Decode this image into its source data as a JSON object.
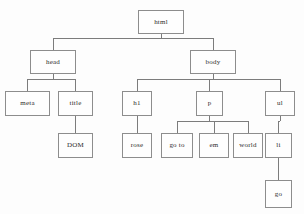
{
  "diagram": {
    "type": "tree",
    "background_color": "#fdfdfd",
    "box_border_color": "#8d8d8d",
    "line_color": "#7c7c7c",
    "text_color": "#2b2b2b",
    "nodes": [
      {
        "id": "html",
        "label": "html",
        "x": 138,
        "y": 10,
        "w": 46,
        "h": 24,
        "level": 0
      },
      {
        "id": "head",
        "label": "head",
        "x": 30,
        "y": 50,
        "w": 46,
        "h": 24,
        "level": 1
      },
      {
        "id": "body",
        "label": "body",
        "x": 190,
        "y": 50,
        "w": 46,
        "h": 24,
        "level": 1
      },
      {
        "id": "meta",
        "label": "meta",
        "x": 5,
        "y": 91,
        "w": 45,
        "h": 25,
        "level": 2
      },
      {
        "id": "title",
        "label": "title",
        "x": 58,
        "y": 91,
        "w": 35,
        "h": 25,
        "level": 2
      },
      {
        "id": "h1",
        "label": "h1",
        "x": 122,
        "y": 91,
        "w": 30,
        "h": 25,
        "level": 2
      },
      {
        "id": "p",
        "label": "p",
        "x": 196,
        "y": 91,
        "w": 27,
        "h": 25,
        "level": 2
      },
      {
        "id": "ul",
        "label": "ul",
        "x": 265,
        "y": 91,
        "w": 30,
        "h": 25,
        "level": 2
      },
      {
        "id": "dom",
        "label": "DOM",
        "x": 58,
        "y": 133,
        "w": 35,
        "h": 25,
        "level": 3
      },
      {
        "id": "rose",
        "label": "rose",
        "x": 122,
        "y": 133,
        "w": 30,
        "h": 25,
        "level": 3
      },
      {
        "id": "goto",
        "label": "go to",
        "x": 161,
        "y": 133,
        "w": 32,
        "h": 25,
        "level": 3
      },
      {
        "id": "em",
        "label": "em",
        "x": 199,
        "y": 133,
        "w": 30,
        "h": 25,
        "level": 3
      },
      {
        "id": "world",
        "label": "world",
        "x": 233,
        "y": 133,
        "w": 30,
        "h": 25,
        "level": 3
      },
      {
        "id": "li",
        "label": "li",
        "x": 265,
        "y": 133,
        "w": 27,
        "h": 25,
        "level": 3
      },
      {
        "id": "go",
        "label": "go",
        "x": 265,
        "y": 180,
        "w": 27,
        "h": 28,
        "level": 4
      }
    ],
    "edges": [
      {
        "from": "html",
        "to": "head"
      },
      {
        "from": "html",
        "to": "body"
      },
      {
        "from": "head",
        "to": "meta"
      },
      {
        "from": "head",
        "to": "title"
      },
      {
        "from": "title",
        "to": "dom"
      },
      {
        "from": "body",
        "to": "h1"
      },
      {
        "from": "body",
        "to": "p"
      },
      {
        "from": "body",
        "to": "ul"
      },
      {
        "from": "h1",
        "to": "rose"
      },
      {
        "from": "p",
        "to": "goto"
      },
      {
        "from": "p",
        "to": "em"
      },
      {
        "from": "p",
        "to": "world"
      },
      {
        "from": "ul",
        "to": "li"
      },
      {
        "from": "li",
        "to": "go"
      }
    ]
  }
}
